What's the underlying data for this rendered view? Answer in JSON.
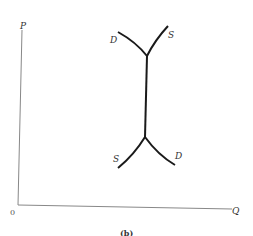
{
  "figure": {
    "caption": "(b)",
    "axes": {
      "y_label": "P",
      "x_label": "Q",
      "origin_label": "0"
    },
    "curves": {
      "upper_demand_label": "D",
      "upper_supply_label": "S",
      "lower_supply_label": "S",
      "lower_demand_label": "D"
    },
    "colors": {
      "axis": "#888888",
      "curve": "#1a1a1a",
      "text": "#333333"
    }
  }
}
